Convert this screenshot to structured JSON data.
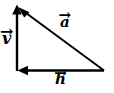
{
  "figure": {
    "type": "vector-diagram",
    "background_color": "#ffffff",
    "stroke_color": "#000000",
    "width": 114,
    "height": 93
  },
  "vectors": [
    {
      "id": "v",
      "label": "v",
      "accent": "→",
      "name": "vertical-vector",
      "direction": "up",
      "from": {
        "x": 17,
        "y": 71
      },
      "to": {
        "x": 17,
        "y": 7
      },
      "arrowhead": "at-tip",
      "label_position": {
        "x": 2,
        "y": 31
      }
    },
    {
      "id": "a",
      "label": "a",
      "accent": "→",
      "name": "hypotenuse-vector",
      "direction": "up-left",
      "from": {
        "x": 104,
        "y": 71
      },
      "to": {
        "x": 19,
        "y": 8
      },
      "arrowhead": "at-tip",
      "label_position": {
        "x": 60,
        "y": 15
      }
    },
    {
      "id": "h",
      "label": "h",
      "accent": "→",
      "name": "horizontal-vector",
      "direction": "left",
      "from": {
        "x": 104,
        "y": 71
      },
      "to": {
        "x": 18,
        "y": 71
      },
      "arrowhead": "at-tip",
      "label_position": {
        "x": 55,
        "y": 72
      }
    }
  ],
  "labels": {
    "v": "v",
    "a": "a",
    "h": "h",
    "accent_arrow": "→"
  }
}
